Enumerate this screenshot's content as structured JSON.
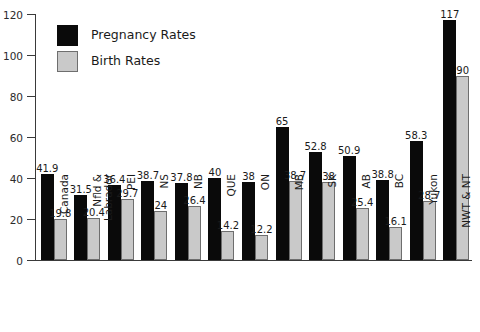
{
  "chart_data": {
    "type": "bar",
    "title": "",
    "xlabel": "",
    "ylabel": "",
    "ylim": [
      0,
      120
    ],
    "yticks": [
      0,
      20,
      40,
      60,
      80,
      100,
      120
    ],
    "grid": false,
    "legend_position": "top-left",
    "categories": [
      "Canada",
      "Nfld &\nLabrador",
      "PEI",
      "NS",
      "NB",
      "QUE",
      "ON",
      "MB",
      "SK",
      "AB",
      "BC",
      "Yukon",
      "NWT & NT"
    ],
    "series": [
      {
        "name": "Pregnancy Rates",
        "color": "#0a0a0a",
        "values": [
          41.9,
          31.5,
          36.4,
          38.7,
          37.8,
          40,
          38,
          65,
          52.8,
          50.9,
          38.8,
          58.3,
          117
        ],
        "labels": [
          "41.9",
          "31.5",
          "36.4",
          "38.7",
          "37.8",
          "40",
          "38",
          "65",
          "52.8",
          "50.9",
          "38.8",
          "58.3",
          "117"
        ]
      },
      {
        "name": "Birth Rates",
        "color": "#c9c9c9",
        "values": [
          19.8,
          20.4,
          29.7,
          24,
          26.4,
          14.2,
          12.2,
          38.7,
          38,
          25.4,
          16.1,
          28.7,
          90
        ],
        "labels": [
          "19.8",
          "20.4",
          "29.7",
          "24",
          "26.4",
          "14.2",
          "12.2",
          "38.7",
          "38",
          "25.4",
          "16.1",
          "28.7",
          "90"
        ]
      }
    ]
  },
  "legend": {
    "items": [
      {
        "label": "Pregnancy Rates",
        "swatch": "pregnancy"
      },
      {
        "label": "Birth Rates",
        "swatch": "birth"
      }
    ]
  }
}
